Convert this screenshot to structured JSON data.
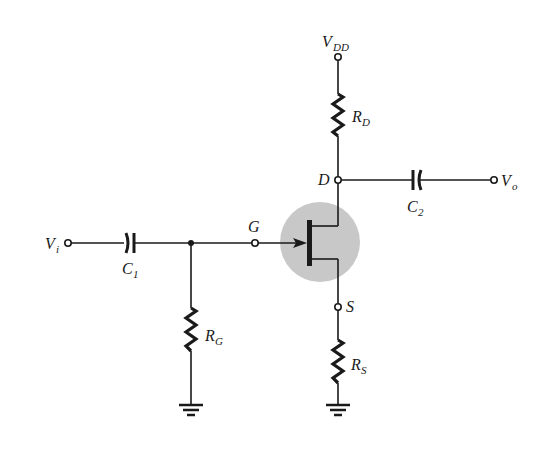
{
  "diagram": {
    "colors": {
      "wire": "#1a1a1a",
      "highlight_circle": "#c8c8c8",
      "background": "#ffffff"
    },
    "labels": {
      "vdd": "V",
      "vdd_sub": "DD",
      "rd": "R",
      "rd_sub": "D",
      "drain": "D",
      "c2": "C",
      "c2_sub": "2",
      "vo": "V",
      "vo_sub": "o",
      "vi": "V",
      "vi_sub": "i",
      "c1": "C",
      "c1_sub": "1",
      "gate": "G",
      "source": "S",
      "rg": "R",
      "rg_sub": "G",
      "rs": "R",
      "rs_sub": "S"
    },
    "components": [
      {
        "id": "VDD",
        "type": "supply-terminal"
      },
      {
        "id": "RD",
        "type": "resistor"
      },
      {
        "id": "C2",
        "type": "capacitor"
      },
      {
        "id": "Vo",
        "type": "output-terminal"
      },
      {
        "id": "Vi",
        "type": "input-terminal"
      },
      {
        "id": "C1",
        "type": "capacitor"
      },
      {
        "id": "RG",
        "type": "resistor"
      },
      {
        "id": "JFET",
        "type": "n-channel-jfet"
      },
      {
        "id": "RS",
        "type": "resistor"
      },
      {
        "id": "GND1",
        "type": "ground"
      },
      {
        "id": "GND2",
        "type": "ground"
      }
    ]
  }
}
